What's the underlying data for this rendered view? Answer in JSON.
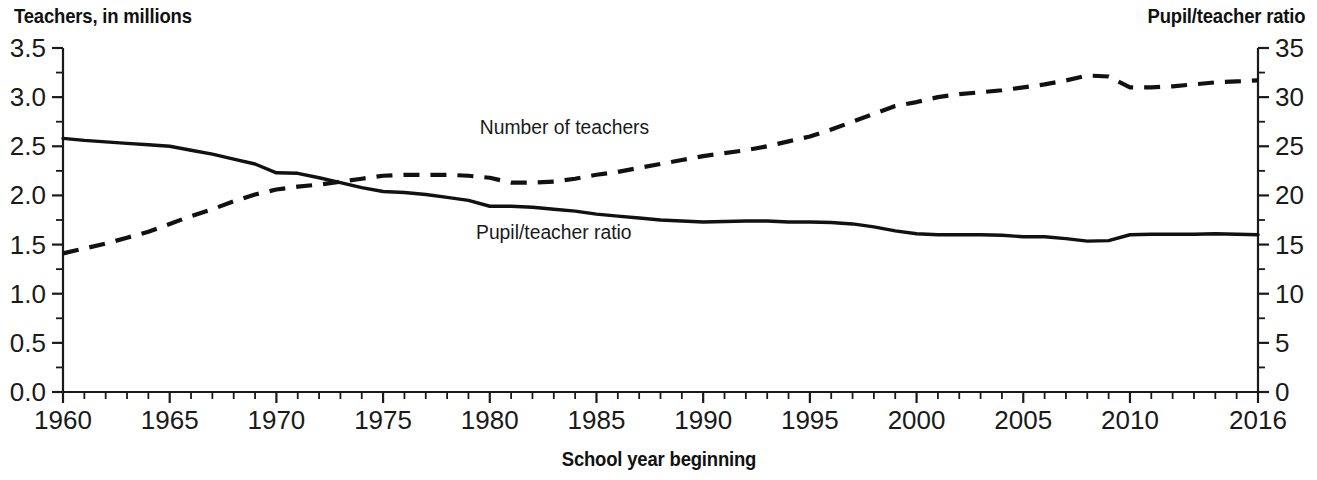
{
  "chart_data": {
    "type": "line",
    "title": "",
    "xlabel": "School year beginning",
    "ylabel": "Teachers, in millions",
    "y2label": "Pupil/teacher ratio",
    "grid": false,
    "legend_position": "inline-annotation",
    "xlim": [
      1960,
      2016
    ],
    "ylim": [
      0.0,
      3.5
    ],
    "y2lim": [
      0,
      35
    ],
    "x_tick_labels": [
      "1960",
      "1965",
      "1970",
      "1975",
      "1980",
      "1985",
      "1990",
      "1995",
      "2000",
      "2005",
      "2010",
      "2016"
    ],
    "x_tick_values": [
      1960,
      1965,
      1970,
      1975,
      1980,
      1985,
      1990,
      1995,
      2000,
      2005,
      2010,
      2016
    ],
    "x_minor_step": 1,
    "y_tick_labels": [
      "0.0",
      "0.5",
      "1.0",
      "1.5",
      "2.0",
      "2.5",
      "3.0",
      "3.5"
    ],
    "y_tick_values": [
      0.0,
      0.5,
      1.0,
      1.5,
      2.0,
      2.5,
      3.0,
      3.5
    ],
    "y_minor_step": 0.25,
    "y2_tick_labels": [
      "0",
      "5",
      "10",
      "15",
      "20",
      "25",
      "30",
      "35"
    ],
    "y2_tick_values": [
      0,
      5,
      10,
      15,
      20,
      25,
      30,
      35
    ],
    "y2_minor_step": 2.5,
    "annotations": [
      {
        "text": "Number of teachers",
        "x": 1983.5,
        "y_axis": "left",
        "y": 2.62
      },
      {
        "text": "Pupil/teacher ratio",
        "x": 1983.0,
        "y_axis": "right",
        "y": 15.6
      }
    ],
    "x": [
      1960,
      1961,
      1962,
      1963,
      1964,
      1965,
      1966,
      1967,
      1968,
      1969,
      1970,
      1971,
      1972,
      1973,
      1974,
      1975,
      1976,
      1977,
      1978,
      1979,
      1980,
      1981,
      1982,
      1983,
      1984,
      1985,
      1986,
      1987,
      1988,
      1989,
      1990,
      1991,
      1992,
      1993,
      1994,
      1995,
      1996,
      1997,
      1998,
      1999,
      2000,
      2001,
      2002,
      2003,
      2004,
      2005,
      2006,
      2007,
      2008,
      2009,
      2010,
      2011,
      2012,
      2013,
      2014,
      2015,
      2016
    ],
    "series": [
      {
        "name": "Number of teachers",
        "axis": "left",
        "units": "millions",
        "style": "dashed",
        "color": "#111111",
        "values": [
          1.41,
          1.46,
          1.51,
          1.57,
          1.63,
          1.71,
          1.79,
          1.86,
          1.94,
          2.01,
          2.06,
          2.09,
          2.11,
          2.14,
          2.17,
          2.2,
          2.21,
          2.21,
          2.21,
          2.2,
          2.18,
          2.13,
          2.13,
          2.14,
          2.17,
          2.21,
          2.24,
          2.28,
          2.32,
          2.36,
          2.4,
          2.43,
          2.46,
          2.5,
          2.55,
          2.6,
          2.67,
          2.75,
          2.83,
          2.91,
          2.95,
          3.0,
          3.03,
          3.05,
          3.07,
          3.1,
          3.13,
          3.17,
          3.22,
          3.21,
          3.1,
          3.1,
          3.11,
          3.13,
          3.15,
          3.16,
          3.17
        ]
      },
      {
        "name": "Pupil/teacher ratio",
        "axis": "right",
        "units": "pupils per teacher",
        "style": "solid",
        "color": "#111111",
        "values": [
          25.8,
          25.6,
          25.45,
          25.3,
          25.15,
          25.0,
          24.6,
          24.2,
          23.7,
          23.2,
          22.3,
          22.25,
          21.8,
          21.3,
          20.8,
          20.4,
          20.3,
          20.1,
          19.8,
          19.5,
          18.9,
          18.9,
          18.8,
          18.6,
          18.4,
          18.1,
          17.9,
          17.7,
          17.5,
          17.4,
          17.3,
          17.35,
          17.4,
          17.4,
          17.3,
          17.3,
          17.25,
          17.1,
          16.8,
          16.4,
          16.1,
          16.0,
          16.0,
          16.0,
          15.95,
          15.8,
          15.8,
          15.6,
          15.35,
          15.4,
          16.0,
          16.05,
          16.05,
          16.05,
          16.1,
          16.05,
          16.0
        ]
      }
    ]
  },
  "left_axis_title": "Teachers, in millions",
  "right_axis_title": "Pupil/teacher ratio",
  "x_axis_title": "School year beginning",
  "colors": {
    "background": "#ffffff",
    "ink": "#111111",
    "axis": "#1a1a1a"
  }
}
